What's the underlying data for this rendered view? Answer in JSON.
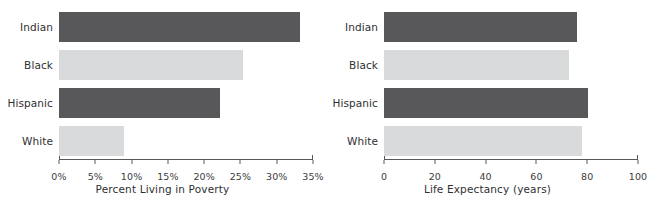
{
  "chart_data": [
    {
      "type": "bar",
      "orientation": "horizontal",
      "title": "",
      "xlabel": "Percent Living in Poverty",
      "ylabel": "",
      "categories": [
        "Indian",
        "Black",
        "Hispanic",
        "White"
      ],
      "values": [
        33.2,
        25.3,
        22.2,
        8.9
      ],
      "value_suffix": "%",
      "xlim": [
        0,
        35
      ],
      "xticks": [
        0,
        5,
        10,
        15,
        20,
        25,
        30,
        35
      ],
      "xticklabels": [
        "0%",
        "5%",
        "10%",
        "15%",
        "20%",
        "25%",
        "30%",
        "35%"
      ],
      "grid": false,
      "legend": "none",
      "bar_colors": [
        "#58585a",
        "#d9dadb",
        "#58585a",
        "#d9dadb"
      ]
    },
    {
      "type": "bar",
      "orientation": "horizontal",
      "title": "",
      "xlabel": "Life Expectancy (years)",
      "ylabel": "",
      "categories": [
        "Indian",
        "Black",
        "Hispanic",
        "White"
      ],
      "values": [
        76,
        73,
        80.5,
        78
      ],
      "value_suffix": "",
      "xlim": [
        0,
        100
      ],
      "xticks": [
        0,
        20,
        40,
        60,
        80,
        100
      ],
      "xticklabels": [
        "0",
        "20",
        "40",
        "60",
        "80",
        "100"
      ],
      "grid": false,
      "legend": "none",
      "bar_colors": [
        "#58585a",
        "#d9dadb",
        "#58585a",
        "#d9dadb"
      ]
    }
  ],
  "colors": {
    "dark_bar": "#58585a",
    "light_bar": "#d9dadb",
    "axis": "#58585a",
    "text": "#2f2f31",
    "background": "#ffffff"
  }
}
